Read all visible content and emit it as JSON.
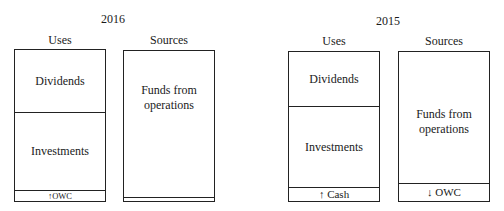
{
  "panels": [
    {
      "year": "2016",
      "uses": {
        "label": "Uses",
        "segments": [
          {
            "label": "Dividends"
          },
          {
            "label": "Investments"
          },
          {
            "label": "↑OWC"
          }
        ]
      },
      "sources": {
        "label": "Sources",
        "segments": [
          {
            "label": "Funds from\noperations"
          },
          {
            "label": ""
          }
        ]
      }
    },
    {
      "year": "2015",
      "uses": {
        "label": "Uses",
        "segments": [
          {
            "label": "Dividends"
          },
          {
            "label": "Investments"
          },
          {
            "label": "↑ Cash"
          }
        ]
      },
      "sources": {
        "label": "Sources",
        "segments": [
          {
            "label": "Funds from\noperations"
          },
          {
            "label": "↓ OWC"
          }
        ]
      }
    }
  ]
}
